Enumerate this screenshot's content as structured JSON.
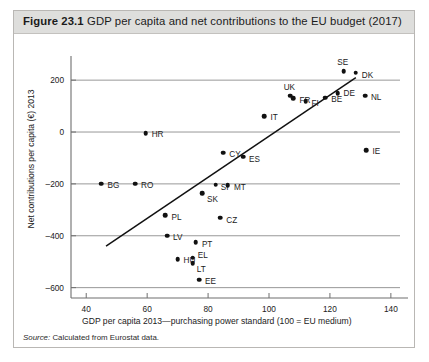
{
  "figure": {
    "label": "Figure 23.1",
    "title": "GDP per capita and net contributions to the EU budget (2017)",
    "source": "Source:",
    "source_text": " Calculated from Eurostat data."
  },
  "chart_data": {
    "type": "scatter",
    "title": "GDP per capita and net contributions to the EU budget (2017)",
    "xlabel": "GDP per capita 2013—purchasing power standard (100 = EU medium)",
    "ylabel": "Net contributions per capita (€) 2013",
    "xlim": [
      35,
      143
    ],
    "ylim": [
      -640,
      270
    ],
    "xticks": [
      40,
      60,
      80,
      100,
      120,
      140
    ],
    "yticks": [
      200,
      0,
      -200,
      -400,
      -600
    ],
    "xtick_labels": [
      "40",
      "60",
      "80",
      "100",
      "120",
      "140"
    ],
    "ytick_labels": [
      "200",
      "0",
      "–200",
      "–400",
      "–600"
    ],
    "grid": "horizontal-at-yticks",
    "legend": "none",
    "marker_color": "#111111",
    "trendline": {
      "label": "linear fit",
      "x_start": 46.5,
      "y_start": -440,
      "x_end": 128.5,
      "y_end": 210,
      "color": "#111111"
    },
    "points": [
      {
        "label": "SE",
        "x": 124.5,
        "y": 235,
        "label_dx": -1,
        "label_dy": -9,
        "label_align": "center"
      },
      {
        "label": "DK",
        "x": 128.5,
        "y": 228,
        "label_dx": 6,
        "label_dy": 2,
        "label_align": "left"
      },
      {
        "label": "DE",
        "x": 122.5,
        "y": 150,
        "label_dx": 6,
        "label_dy": 0,
        "label_align": "left"
      },
      {
        "label": "NL",
        "x": 131.5,
        "y": 140,
        "label_dx": 6,
        "label_dy": 1,
        "label_align": "left"
      },
      {
        "label": "BE",
        "x": 118.5,
        "y": 133,
        "label_dx": 6,
        "label_dy": 1,
        "label_align": "left"
      },
      {
        "label": "UK",
        "x": 107.0,
        "y": 140,
        "label_dx": -1,
        "label_dy": -9,
        "label_align": "center"
      },
      {
        "label": "FR",
        "x": 108.0,
        "y": 130,
        "label_dx": 6,
        "label_dy": 2,
        "label_align": "left"
      },
      {
        "label": "FI",
        "x": 112.0,
        "y": 118,
        "label_dx": 6,
        "label_dy": 2,
        "label_align": "left"
      },
      {
        "label": "IT",
        "x": 98.5,
        "y": 60,
        "label_dx": 6,
        "label_dy": 1,
        "label_align": "left"
      },
      {
        "label": "IE",
        "x": 132.0,
        "y": -70,
        "label_dx": 6,
        "label_dy": 1,
        "label_align": "left"
      },
      {
        "label": "HR",
        "x": 59.5,
        "y": -5,
        "label_dx": 6,
        "label_dy": 1,
        "label_align": "left"
      },
      {
        "label": "CY",
        "x": 85.0,
        "y": -80,
        "label_dx": 6,
        "label_dy": 1,
        "label_align": "left"
      },
      {
        "label": "ES",
        "x": 91.5,
        "y": -95,
        "label_dx": 6,
        "label_dy": 2,
        "label_align": "left"
      },
      {
        "label": "BG",
        "x": 45.0,
        "y": -200,
        "label_dx": 6,
        "label_dy": 1,
        "label_align": "left"
      },
      {
        "label": "RO",
        "x": 56.0,
        "y": -200,
        "label_dx": 6,
        "label_dy": 1,
        "label_align": "left"
      },
      {
        "label": "SI",
        "x": 82.5,
        "y": -203,
        "label_dx": 5,
        "label_dy": 2,
        "label_align": "left"
      },
      {
        "label": "MT",
        "x": 86.5,
        "y": -205,
        "label_dx": 6,
        "label_dy": 2,
        "label_align": "left"
      },
      {
        "label": "SK",
        "x": 78.0,
        "y": -235,
        "label_dx": 5,
        "label_dy": 6,
        "label_align": "left"
      },
      {
        "label": "PL",
        "x": 66.0,
        "y": -320,
        "label_dx": 6,
        "label_dy": 2,
        "label_align": "left"
      },
      {
        "label": "CZ",
        "x": 84.0,
        "y": -330,
        "label_dx": 6,
        "label_dy": 2,
        "label_align": "left"
      },
      {
        "label": "LV",
        "x": 66.5,
        "y": -400,
        "label_dx": 6,
        "label_dy": 1,
        "label_align": "left"
      },
      {
        "label": "PT",
        "x": 76.0,
        "y": -425,
        "label_dx": 6,
        "label_dy": 2,
        "label_align": "left"
      },
      {
        "label": "HU",
        "x": 70.0,
        "y": -490,
        "label_dx": 6,
        "label_dy": 1,
        "label_align": "left"
      },
      {
        "label": "EL",
        "x": 75.0,
        "y": -485,
        "label_dx": 5,
        "label_dy": -3,
        "label_align": "left"
      },
      {
        "label": "LT",
        "x": 75.0,
        "y": -505,
        "label_dx": 4,
        "label_dy": 6,
        "label_align": "left"
      },
      {
        "label": "EE",
        "x": 77.0,
        "y": -570,
        "label_dx": 6,
        "label_dy": 1,
        "label_align": "left"
      }
    ]
  }
}
